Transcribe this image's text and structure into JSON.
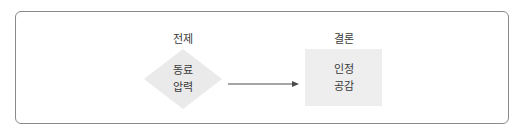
{
  "diagram": {
    "premise": {
      "heading": "전제",
      "shape": "diamond",
      "lines": [
        "동료",
        "압력"
      ],
      "fill": "#eaeaea"
    },
    "conclusion": {
      "heading": "결론",
      "shape": "square",
      "lines": [
        "인정",
        "공감"
      ],
      "fill": "#eeeeee"
    },
    "edge": {
      "from": "premise",
      "to": "conclusion",
      "icon": "arrow-right-icon",
      "color": "#4a4a4a"
    },
    "frame_border_color": "#8a8a8a",
    "text_color": "#3a3a3a"
  }
}
